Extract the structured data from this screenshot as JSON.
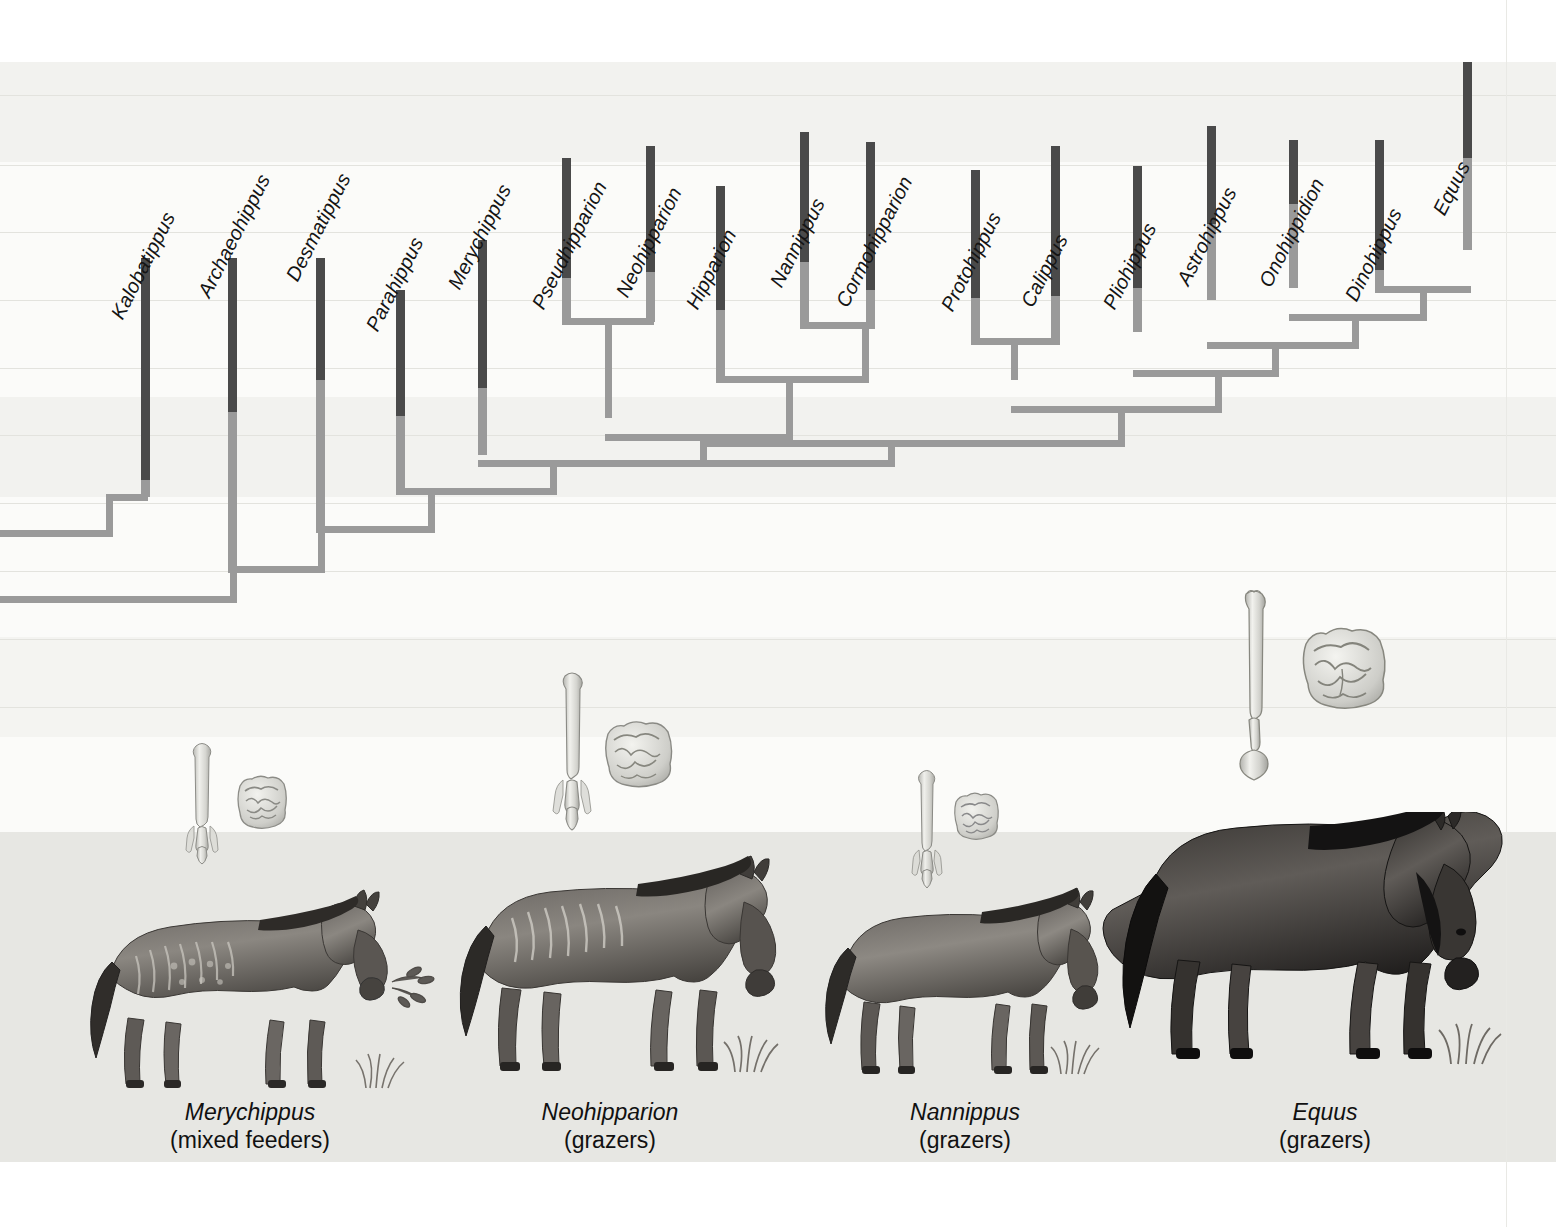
{
  "figure": {
    "kind": "cladogram-with-illustrations",
    "title_text": "",
    "background_bands": [
      {
        "top": 0,
        "height": 62,
        "shade": "#ffffff"
      },
      {
        "top": 62,
        "height": 100,
        "shade": "#f2f2ef"
      },
      {
        "top": 162,
        "height": 235,
        "shade": "#fbfbf9"
      },
      {
        "top": 397,
        "height": 100,
        "shade": "#f2f2ef"
      },
      {
        "top": 497,
        "height": 140,
        "shade": "#fbfbf9"
      },
      {
        "top": 637,
        "height": 100,
        "shade": "#f4f4f1"
      },
      {
        "top": 737,
        "height": 95,
        "shade": "#fbfbf9"
      },
      {
        "top": 832,
        "height": 330,
        "shade": "#e7e7e3"
      },
      {
        "top": 1162,
        "height": 65,
        "shade": "#ffffff"
      }
    ],
    "gridlines_y": [
      95,
      165,
      232,
      300,
      368,
      435,
      503,
      571,
      639,
      707
    ],
    "colors": {
      "bar_dark": "#4a4a4a",
      "bar_light": "#9a9a9a",
      "branch": "#9a9a9a",
      "gridline": "#e3e3de",
      "ground": "#e6e6e2",
      "text": "#141414"
    }
  },
  "taxa": [
    {
      "name": "Kalobatippus",
      "x": 145,
      "label_y": 300,
      "bar_top": 258,
      "dark_bottom": 480,
      "bar_bottom": 497
    },
    {
      "name": "Archaeohippus",
      "x": 232,
      "label_y": 280,
      "bar_top": 258,
      "dark_bottom": 412,
      "bar_bottom": 570
    },
    {
      "name": "Desmatippus",
      "x": 320,
      "label_y": 262,
      "bar_top": 258,
      "dark_bottom": 380,
      "bar_bottom": 530
    },
    {
      "name": "Parahippus",
      "x": 400,
      "label_y": 310,
      "bar_top": 290,
      "dark_bottom": 416,
      "bar_bottom": 490
    },
    {
      "name": "Merychippus",
      "x": 482,
      "label_y": 268,
      "bar_top": 240,
      "dark_bottom": 388,
      "bar_bottom": 455
    },
    {
      "name": "Pseudhipparion",
      "x": 566,
      "label_y": 276,
      "bar_top": 158,
      "dark_bottom": 278,
      "bar_bottom": 322
    },
    {
      "name": "Neohipparion",
      "x": 650,
      "label_y": 268,
      "bar_top": 146,
      "dark_bottom": 272,
      "bar_bottom": 322
    },
    {
      "name": "Hipparion",
      "x": 720,
      "label_y": 286,
      "bar_top": 186,
      "dark_bottom": 310,
      "bar_bottom": 380
    },
    {
      "name": "Nannippus",
      "x": 804,
      "label_y": 264,
      "bar_top": 132,
      "dark_bottom": 262,
      "bar_bottom": 326
    },
    {
      "name": "Cormohipparion",
      "x": 870,
      "label_y": 272,
      "bar_top": 142,
      "dark_bottom": 290,
      "bar_bottom": 326
    },
    {
      "name": "Protohippus",
      "x": 975,
      "label_y": 282,
      "bar_top": 170,
      "dark_bottom": 298,
      "bar_bottom": 342
    },
    {
      "name": "Calippus",
      "x": 1055,
      "label_y": 280,
      "bar_top": 146,
      "dark_bottom": 296,
      "bar_bottom": 342
    },
    {
      "name": "Pliohippus",
      "x": 1137,
      "label_y": 284,
      "bar_top": 166,
      "dark_bottom": 288,
      "bar_bottom": 332
    },
    {
      "name": "Astrohippus",
      "x": 1211,
      "label_y": 258,
      "bar_top": 126,
      "dark_bottom": 224,
      "bar_bottom": 300
    },
    {
      "name": "Onohippidion",
      "x": 1293,
      "label_y": 256,
      "bar_top": 140,
      "dark_bottom": 204,
      "bar_bottom": 288
    },
    {
      "name": "Dinohippus",
      "x": 1379,
      "label_y": 274,
      "bar_top": 140,
      "dark_bottom": 270,
      "bar_bottom": 290
    },
    {
      "name": "Equus",
      "x": 1467,
      "label_y": 200,
      "bar_top": 62,
      "dark_bottom": 158,
      "bar_bottom": 250
    }
  ],
  "illustration_groups": [
    {
      "taxon": "Merychippus",
      "diet": "(mixed feeders)",
      "caption_genus": "Merychippus",
      "caption_diet": "(mixed feeders)",
      "limb_bone": "three-toed-metapodial",
      "tooth": "low-crowned-molar",
      "size_class": "small"
    },
    {
      "taxon": "Neohipparion",
      "diet": "(grazers)",
      "caption_genus": "Neohipparion",
      "caption_diet": "(grazers)",
      "limb_bone": "three-toed-metapodial",
      "tooth": "high-crowned-molar",
      "size_class": "medium"
    },
    {
      "taxon": "Nannippus",
      "diet": "(grazers)",
      "caption_genus": "Nannippus",
      "caption_diet": "(grazers)",
      "limb_bone": "three-toed-metapodial",
      "tooth": "high-crowned-molar",
      "size_class": "small-medium"
    },
    {
      "taxon": "Equus",
      "diet": "(grazers)",
      "caption_genus": "Equus",
      "caption_diet": "(grazers)",
      "limb_bone": "single-toed-cannon-bone",
      "tooth": "very-high-crowned-molar",
      "size_class": "large"
    }
  ],
  "captions": [
    {
      "genus": "Merychippus",
      "diet": "(mixed feeders)",
      "x": 90,
      "width": 320
    },
    {
      "genus": "Neohipparion",
      "diet": "(grazers)",
      "x": 450,
      "width": 320
    },
    {
      "genus": "Nannippus",
      "diet": "(grazers)",
      "x": 805,
      "width": 320
    },
    {
      "genus": "Equus",
      "diet": "(grazers)",
      "x": 1165,
      "width": 320
    }
  ]
}
